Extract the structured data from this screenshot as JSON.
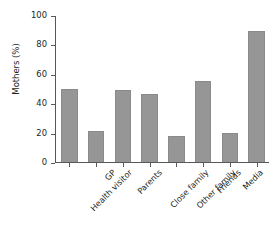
{
  "chart_data": {
    "type": "bar",
    "title": "",
    "xlabel": "",
    "ylabel": "Mothers (%)",
    "ylim": [
      0,
      100
    ],
    "yticks": [
      0,
      20,
      40,
      60,
      80,
      100
    ],
    "grid": false,
    "legend": null,
    "bar_color": "#969696",
    "axis_color": "#58585a",
    "categories": [
      "Health visitor",
      "GP",
      "Parents",
      "Close family",
      "Other family",
      "Friends",
      "Media",
      "Own 'research'"
    ],
    "values": [
      50,
      21,
      49,
      46,
      18,
      55,
      20,
      89
    ]
  }
}
